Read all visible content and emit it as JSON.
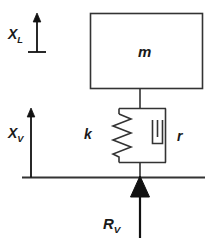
{
  "diagram": {
    "type": "schematic",
    "stroke_color": "#333333",
    "fill_color": "#111111",
    "background_color": "#ffffff",
    "labels": {
      "mass": {
        "base": "m",
        "sub": ""
      },
      "spring": {
        "base": "k",
        "sub": ""
      },
      "damper": {
        "base": "r",
        "sub": ""
      },
      "displacement_load": {
        "base": "X",
        "sub": "L"
      },
      "displacement_valve": {
        "base": "X",
        "sub": "V"
      },
      "force_valve": {
        "base": "R",
        "sub": "V"
      }
    },
    "elements": [
      {
        "name": "mass-block",
        "label": "m",
        "shape": "rectangle"
      },
      {
        "name": "spring",
        "label": "k",
        "shape": "zigzag"
      },
      {
        "name": "damper",
        "label": "r",
        "shape": "dashpot"
      },
      {
        "name": "ground-line",
        "label": "",
        "shape": "line"
      },
      {
        "name": "force-arrow",
        "label": "R_V",
        "shape": "arrow-up"
      },
      {
        "name": "displacement-arrow-load",
        "label": "X_L",
        "shape": "arrow-up"
      },
      {
        "name": "displacement-arrow-valve",
        "label": "X_V",
        "shape": "arrow-up"
      }
    ]
  }
}
